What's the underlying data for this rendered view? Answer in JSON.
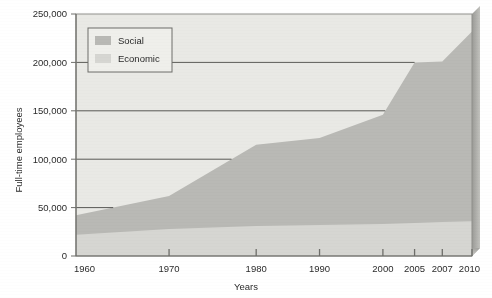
{
  "chart_data": {
    "type": "area",
    "stacked": true,
    "title": "",
    "subtitle": "",
    "xlabel": "Years",
    "ylabel": "Full-time employees",
    "categories": [
      "1960",
      "1970",
      "1980",
      "1990",
      "2000",
      "2005",
      "2007",
      "2010"
    ],
    "ylim": [
      0,
      250000
    ],
    "yticks": [
      0,
      50000,
      100000,
      150000,
      200000,
      250000
    ],
    "ytick_labels": [
      "0",
      "50,000",
      "100,000",
      "150,000",
      "200,000",
      "250,000"
    ],
    "xticks": [
      "1960",
      "1970",
      "1980",
      "1990",
      "2000",
      "2005",
      "2007",
      "2010"
    ],
    "grid": false,
    "legend_position": "top-left",
    "series": [
      {
        "name": "Economic",
        "color": "#d6d6d2",
        "values": [
          22000,
          28000,
          31000,
          32000,
          33000,
          34000,
          35000,
          36000
        ]
      },
      {
        "name": "Social",
        "color": "#b9b9b5",
        "values": [
          20000,
          34000,
          84000,
          90000,
          113000,
          166000,
          166000,
          196000
        ]
      }
    ],
    "totals": [
      42000,
      62000,
      115000,
      122000,
      146000,
      200000,
      201000,
      232000
    ],
    "annotations": []
  },
  "legend": {
    "entries": [
      {
        "label": "Social",
        "color": "#b9b9b5"
      },
      {
        "label": "Economic",
        "color": "#d6d6d2"
      }
    ]
  },
  "axes": {
    "y_title": "Full-time employees",
    "x_title": "Years"
  },
  "colors": {
    "plot_background": "#e9e9e5",
    "social": "#b9b9b5",
    "economic": "#d6d6d2",
    "frame": "#8f8f8b",
    "bevel_top": "#c8c8c4",
    "bevel_side": "#9a9a96",
    "axis_line": "#6e6e6a",
    "text": "#2b2b2b"
  }
}
